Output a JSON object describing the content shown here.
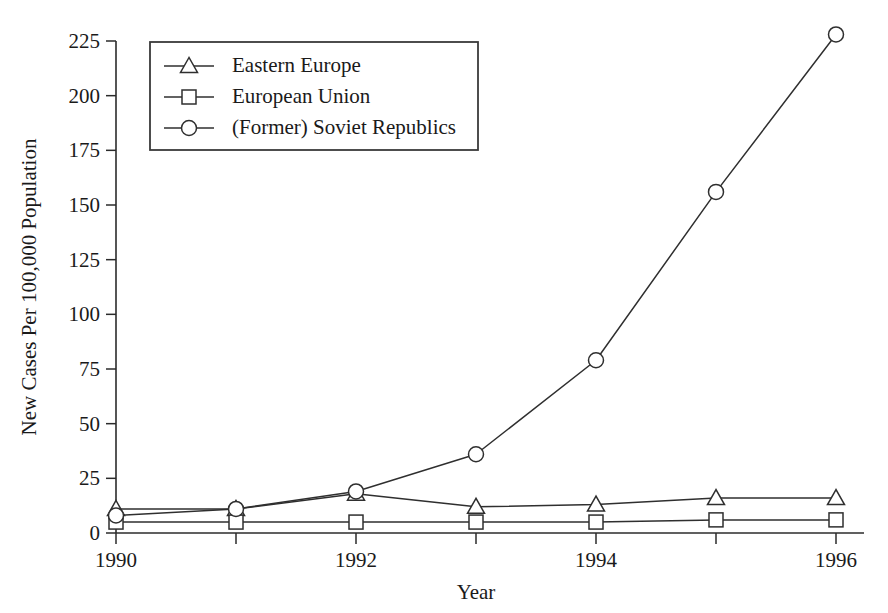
{
  "chart_data": {
    "type": "line",
    "title": "",
    "xlabel": "Year",
    "ylabel": "New Cases Per 100,000 Population",
    "x": [
      1990,
      1991,
      1992,
      1993,
      1994,
      1995,
      1996
    ],
    "xlim": [
      1990,
      1996
    ],
    "ylim": [
      0,
      225
    ],
    "x_tick_labels": [
      "1990",
      "1992",
      "1994",
      "1996"
    ],
    "x_tick_values": [
      1990,
      1992,
      1994,
      1996
    ],
    "x_minor_ticks": [
      1991,
      1993,
      1995
    ],
    "y_tick_labels": [
      "0",
      "25",
      "50",
      "75",
      "100",
      "125",
      "150",
      "175",
      "200",
      "225"
    ],
    "y_tick_values": [
      0,
      25,
      50,
      75,
      100,
      125,
      150,
      175,
      200,
      225
    ],
    "grid": false,
    "legend_position": "top-left",
    "series": [
      {
        "name": "Eastern Europe",
        "marker": "triangle",
        "values": [
          11,
          11,
          18,
          12,
          13,
          16,
          16
        ]
      },
      {
        "name": "European Union",
        "marker": "square",
        "values": [
          5,
          5,
          5,
          5,
          5,
          6,
          6
        ]
      },
      {
        "name": "(Former) Soviet Republics",
        "marker": "circle",
        "values": [
          8,
          11,
          19,
          36,
          79,
          156,
          228
        ]
      }
    ]
  },
  "legend": {
    "entries": [
      {
        "label": "Eastern Europe",
        "marker": "triangle"
      },
      {
        "label": "European Union",
        "marker": "square"
      },
      {
        "label": "(Former) Soviet Republics",
        "marker": "circle"
      }
    ]
  },
  "colors": {
    "line": "#2f2f2f",
    "axis": "#2b2b2b",
    "marker_fill": "#ffffff",
    "background": "#ffffff",
    "text": "#1a1a1a"
  }
}
